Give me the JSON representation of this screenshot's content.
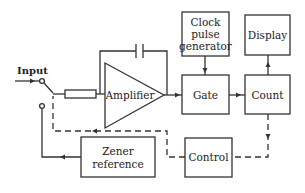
{
  "diagram": {
    "input_label": "Input",
    "blocks": {
      "amplifier": "Amplifier",
      "clock": [
        "Clock",
        "pulse",
        "generator"
      ],
      "display": "Display",
      "gate": "Gate",
      "count": "Count",
      "control": "Control",
      "zener": [
        "Zener",
        "reference"
      ]
    },
    "colors": {
      "stroke": "#333333",
      "background": "#ffffff"
    }
  }
}
